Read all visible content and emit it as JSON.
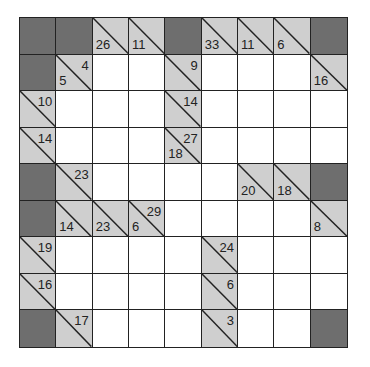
{
  "puzzle": {
    "type": "kakuro",
    "rows": 9,
    "cols": 9,
    "colors": {
      "dark": "#6e6e6e",
      "clue": "#cfcfcf",
      "white": "#ffffff",
      "line": "#222222"
    },
    "cells": [
      [
        {
          "t": "dark"
        },
        {
          "t": "dark"
        },
        {
          "t": "clue",
          "down": "26"
        },
        {
          "t": "clue",
          "down": "11"
        },
        {
          "t": "dark"
        },
        {
          "t": "clue",
          "down": "33"
        },
        {
          "t": "clue",
          "down": "11"
        },
        {
          "t": "clue",
          "down": "6"
        },
        {
          "t": "dark"
        }
      ],
      [
        {
          "t": "dark"
        },
        {
          "t": "clue",
          "right": "4",
          "down": "5"
        },
        {
          "t": "white"
        },
        {
          "t": "white"
        },
        {
          "t": "clue",
          "right": "9"
        },
        {
          "t": "white"
        },
        {
          "t": "white"
        },
        {
          "t": "white"
        },
        {
          "t": "clue",
          "down": "16"
        }
      ],
      [
        {
          "t": "clue",
          "right": "10"
        },
        {
          "t": "white"
        },
        {
          "t": "white"
        },
        {
          "t": "white"
        },
        {
          "t": "clue",
          "right": "14"
        },
        {
          "t": "white"
        },
        {
          "t": "white"
        },
        {
          "t": "white"
        },
        {
          "t": "white"
        }
      ],
      [
        {
          "t": "clue",
          "right": "14"
        },
        {
          "t": "white"
        },
        {
          "t": "white"
        },
        {
          "t": "white"
        },
        {
          "t": "clue",
          "right": "27",
          "down": "18"
        },
        {
          "t": "white"
        },
        {
          "t": "white"
        },
        {
          "t": "white"
        },
        {
          "t": "white"
        }
      ],
      [
        {
          "t": "dark"
        },
        {
          "t": "clue",
          "right": "23"
        },
        {
          "t": "white"
        },
        {
          "t": "white"
        },
        {
          "t": "white"
        },
        {
          "t": "white"
        },
        {
          "t": "clue",
          "down": "20"
        },
        {
          "t": "clue",
          "down": "18"
        },
        {
          "t": "dark"
        }
      ],
      [
        {
          "t": "dark"
        },
        {
          "t": "clue",
          "down": "14"
        },
        {
          "t": "clue",
          "down": "23"
        },
        {
          "t": "clue",
          "right": "29",
          "down": "6"
        },
        {
          "t": "white"
        },
        {
          "t": "white"
        },
        {
          "t": "white"
        },
        {
          "t": "white"
        },
        {
          "t": "clue",
          "down": "8"
        }
      ],
      [
        {
          "t": "clue",
          "right": "19"
        },
        {
          "t": "white"
        },
        {
          "t": "white"
        },
        {
          "t": "white"
        },
        {
          "t": "white"
        },
        {
          "t": "clue",
          "right": "24"
        },
        {
          "t": "white"
        },
        {
          "t": "white"
        },
        {
          "t": "white"
        }
      ],
      [
        {
          "t": "clue",
          "right": "16"
        },
        {
          "t": "white"
        },
        {
          "t": "white"
        },
        {
          "t": "white"
        },
        {
          "t": "white"
        },
        {
          "t": "clue",
          "right": "6"
        },
        {
          "t": "white"
        },
        {
          "t": "white"
        },
        {
          "t": "white"
        }
      ],
      [
        {
          "t": "dark"
        },
        {
          "t": "clue",
          "right": "17"
        },
        {
          "t": "white"
        },
        {
          "t": "white"
        },
        {
          "t": "white"
        },
        {
          "t": "clue",
          "right": "3"
        },
        {
          "t": "white"
        },
        {
          "t": "white"
        },
        {
          "t": "dark"
        }
      ]
    ]
  }
}
